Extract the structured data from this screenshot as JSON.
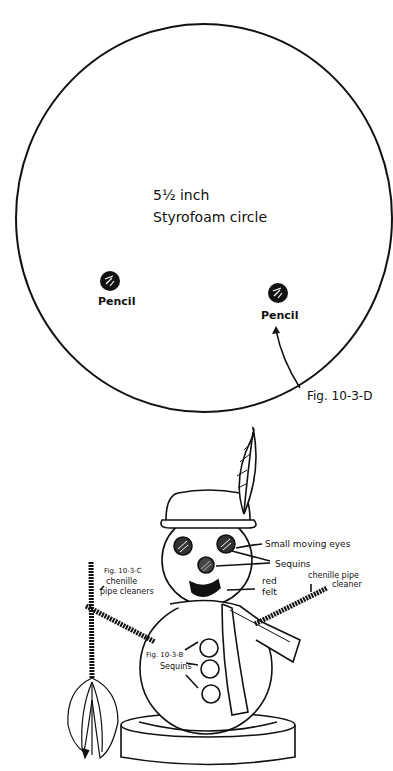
{
  "figure_d": {
    "circle_label_line1": "5½ inch",
    "circle_label_line2": "Styrofoam circle",
    "pencil_left_label": "Pencil",
    "pencil_right_label": "Pencil",
    "fig_label": "Fig. 10-3-D"
  },
  "snowman": {
    "eyes_label": "Small moving eyes",
    "sequins_label": "Sequins",
    "felt_label_line1": "red",
    "felt_label_line2": "felt",
    "pipe_right_line1": "chenille pipe",
    "pipe_right_line2": "cleaner",
    "fig_c_line1": "Fig. 10-3-C",
    "fig_c_line2": "chenille",
    "fig_c_line3": "pipe cleaners",
    "fig_b_line1": "Fig. 10-3-B",
    "fig_b_line2": "Sequins"
  },
  "colors": {
    "ink": "#111111",
    "paper": "#ffffff"
  }
}
